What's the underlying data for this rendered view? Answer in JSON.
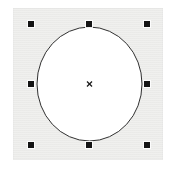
{
  "app": {
    "title": "Drawing Canvas",
    "surface_color": "#ececea",
    "page_background": "#ffffff"
  },
  "canvas": {
    "name": "artboard",
    "x": 13,
    "y": 8,
    "width": 150,
    "height": 152,
    "fill": "#ececea"
  },
  "shape": {
    "type": "ellipse",
    "label": "Circle",
    "center_x": 89.5,
    "center_y": 84,
    "radius_x": 52.5,
    "radius_y": 57,
    "fill": "#ffffff",
    "stroke": "#303030",
    "stroke_width": 1,
    "selected": true
  },
  "center_marker": {
    "name": "center-cross",
    "glyph": "x",
    "x": 89.5,
    "y": 84,
    "size": 5,
    "color": "#1a1a1a"
  },
  "selection": {
    "handle_color": "#141414",
    "handle_size": 6,
    "handles": [
      {
        "id": "nw",
        "label": "Top-left resize handle",
        "x": 31,
        "y": 24
      },
      {
        "id": "n",
        "label": "Top-center resize handle",
        "x": 89,
        "y": 24
      },
      {
        "id": "ne",
        "label": "Top-right resize handle",
        "x": 147,
        "y": 24
      },
      {
        "id": "w",
        "label": "Middle-left resize handle",
        "x": 31,
        "y": 84
      },
      {
        "id": "e",
        "label": "Middle-right resize handle",
        "x": 147,
        "y": 84
      },
      {
        "id": "sw",
        "label": "Bottom-left resize handle",
        "x": 31,
        "y": 145
      },
      {
        "id": "s",
        "label": "Bottom-center resize handle",
        "x": 89,
        "y": 145
      },
      {
        "id": "se",
        "label": "Bottom-right resize handle",
        "x": 147,
        "y": 145
      }
    ]
  }
}
